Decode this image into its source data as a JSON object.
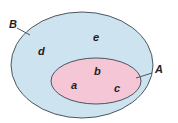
{
  "diagram": {
    "type": "venn-subset",
    "sets": [
      {
        "name": "B",
        "label": "B",
        "fill": "#cde3ef",
        "stroke": "#3a4650",
        "elements": [
          "d",
          "e"
        ]
      },
      {
        "name": "A",
        "label": "A",
        "fill": "#f4c6d6",
        "stroke": "#3a4650",
        "elements": [
          "a",
          "b",
          "c"
        ]
      }
    ],
    "relationship": "A is a subset of B",
    "elements": {
      "a": "a",
      "b": "b",
      "c": "c",
      "d": "d",
      "e": "e"
    },
    "set_labels": {
      "outer": "B",
      "inner": "A"
    }
  }
}
